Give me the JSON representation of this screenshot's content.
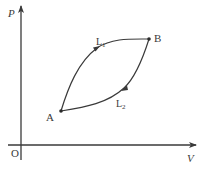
{
  "diagram": {
    "type": "P-V diagram",
    "axes": {
      "y_label": "P",
      "x_label": "V",
      "origin_label": "O"
    },
    "points": [
      {
        "id": "A",
        "label": "A"
      },
      {
        "id": "B",
        "label": "B"
      }
    ],
    "curves": [
      {
        "id": "L1",
        "label_main": "L",
        "label_sub": "1",
        "from": "A",
        "to": "B",
        "direction": "A to B (upper path)"
      },
      {
        "id": "L2",
        "label_main": "L",
        "label_sub": "2",
        "from": "B",
        "to": "A",
        "direction": "B to A (lower path)"
      }
    ],
    "colors": {
      "line": "#3a3a3a",
      "background": "#ffffff"
    }
  }
}
